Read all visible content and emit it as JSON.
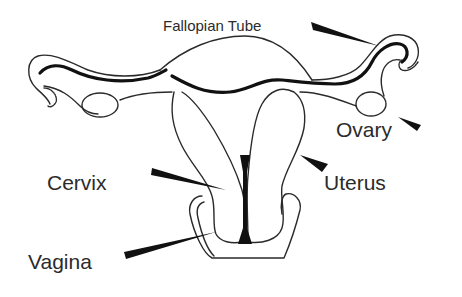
{
  "diagram": {
    "labels": {
      "fallopian_tube": "Fallopian Tube",
      "ovary": "Ovary",
      "uterus": "Uterus",
      "cervix": "Cervix",
      "vagina": "Vagina"
    },
    "colors": {
      "background": "#ffffff",
      "line": "#2a2a2a",
      "pointer": "#111111",
      "text": "#2b2b2b"
    }
  }
}
